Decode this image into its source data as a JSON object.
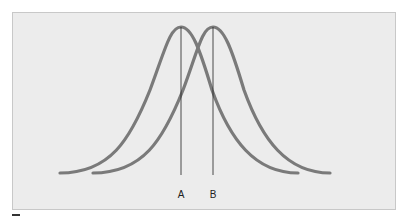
{
  "figure": {
    "background_color": "#ececec",
    "curve_color": "#7a7a7a",
    "line_color": "#222222",
    "curves": [
      {
        "name": "curve-1",
        "start_x": 60,
        "peak_x": 181,
        "end_x": 298
      },
      {
        "name": "curve-2",
        "start_x": 93,
        "peak_x": 213,
        "end_x": 330
      }
    ],
    "markers": [
      {
        "label": "A",
        "x": 181
      },
      {
        "label": "B",
        "x": 213
      }
    ]
  }
}
